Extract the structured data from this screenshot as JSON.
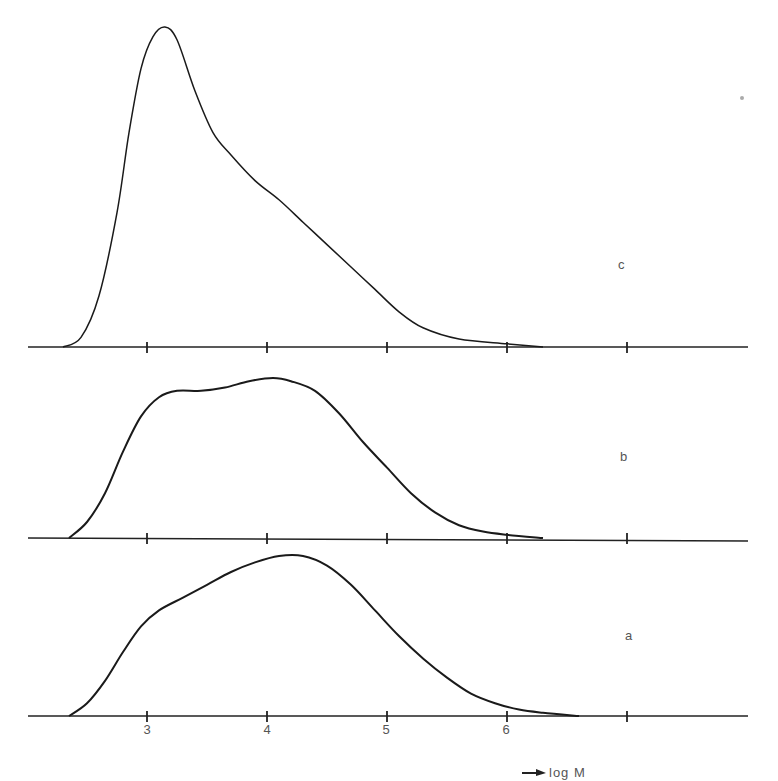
{
  "figure": {
    "panels": [
      {
        "id": "c",
        "label": "c",
        "baseline_y": 347,
        "label_pos": [
          618,
          265
        ]
      },
      {
        "id": "b",
        "label": "b",
        "baseline_y": 538,
        "label_pos": [
          620,
          457
        ]
      },
      {
        "id": "a",
        "label": "a",
        "baseline_y": 716,
        "label_pos": [
          625,
          636
        ]
      }
    ],
    "x_tick_labels": [
      "3",
      "4",
      "5",
      "6"
    ],
    "x_axis_title": "log M",
    "x_axis_arrow": "right-arrow",
    "colors": {
      "line": "#1a1a1a",
      "axis": "#222222",
      "text": "#555555"
    }
  },
  "chart_data": {
    "type": "line",
    "title": "",
    "xlabel": "log M",
    "ylabel": "",
    "xlim": [
      2.0,
      7.0
    ],
    "x_ticks": [
      3,
      4,
      5,
      6,
      7
    ],
    "x_tick_labels": [
      "3",
      "4",
      "5",
      "6"
    ],
    "grid": false,
    "legend": "panel letters at right (c top, b middle, a bottom)",
    "note": "Three stacked molecular-weight distribution curves; y values are relative heights (0-1 normalized to tallest curve c).",
    "series": [
      {
        "name": "c",
        "x": [
          2.3,
          2.45,
          2.6,
          2.75,
          2.85,
          2.95,
          3.05,
          3.15,
          3.25,
          3.4,
          3.55,
          3.7,
          3.9,
          4.1,
          4.3,
          4.5,
          4.7,
          4.9,
          5.1,
          5.3,
          5.6,
          6.0,
          6.3
        ],
        "y": [
          0.0,
          0.03,
          0.16,
          0.42,
          0.67,
          0.87,
          0.97,
          1.0,
          0.96,
          0.8,
          0.67,
          0.6,
          0.52,
          0.46,
          0.39,
          0.32,
          0.25,
          0.18,
          0.11,
          0.06,
          0.025,
          0.01,
          0.0
        ]
      },
      {
        "name": "b",
        "x": [
          2.35,
          2.5,
          2.65,
          2.8,
          2.95,
          3.1,
          3.25,
          3.45,
          3.65,
          3.85,
          4.05,
          4.2,
          4.4,
          4.6,
          4.8,
          5.0,
          5.2,
          5.4,
          5.6,
          5.8,
          6.0,
          6.3
        ],
        "y": [
          0.0,
          0.05,
          0.14,
          0.27,
          0.38,
          0.44,
          0.46,
          0.46,
          0.47,
          0.49,
          0.5,
          0.49,
          0.46,
          0.39,
          0.3,
          0.22,
          0.14,
          0.08,
          0.04,
          0.02,
          0.01,
          0.0
        ]
      },
      {
        "name": "a",
        "x": [
          2.35,
          2.5,
          2.65,
          2.8,
          2.95,
          3.1,
          3.3,
          3.5,
          3.7,
          3.9,
          4.1,
          4.3,
          4.5,
          4.7,
          4.9,
          5.1,
          5.3,
          5.5,
          5.7,
          5.9,
          6.1,
          6.3,
          6.6
        ],
        "y": [
          0.0,
          0.04,
          0.11,
          0.2,
          0.28,
          0.33,
          0.37,
          0.41,
          0.45,
          0.48,
          0.5,
          0.5,
          0.47,
          0.41,
          0.33,
          0.25,
          0.18,
          0.12,
          0.07,
          0.04,
          0.02,
          0.01,
          0.0
        ]
      }
    ]
  }
}
